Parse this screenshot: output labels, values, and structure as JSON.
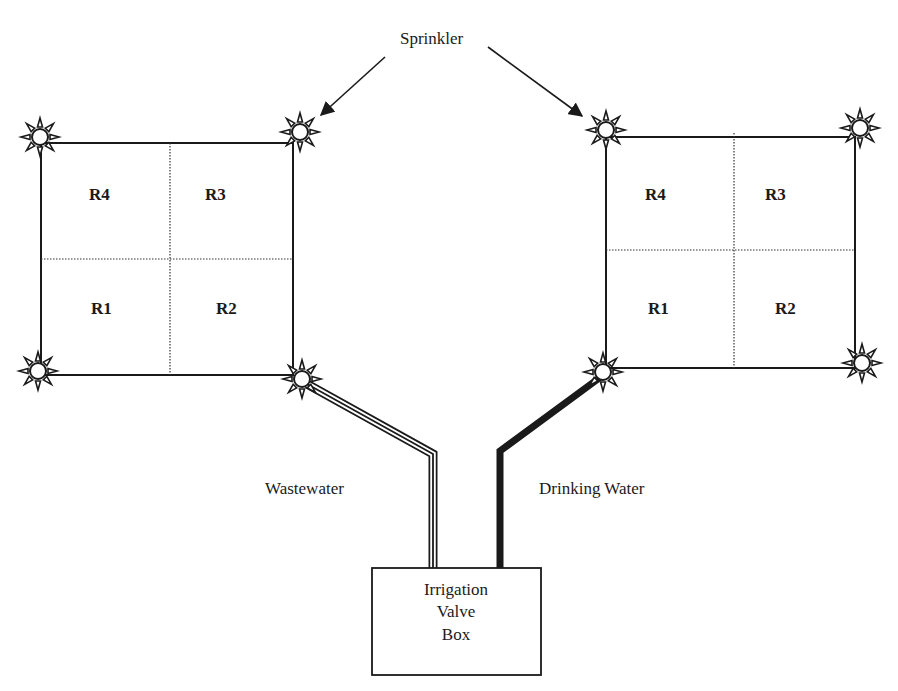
{
  "annotations": {
    "sprinkler": "Sprinkler",
    "wastewater": "Wastewater",
    "drinking_water": "Drinking Water"
  },
  "valve_box": {
    "lines": [
      "Irrigation",
      "Valve",
      "Box"
    ]
  },
  "plots": [
    {
      "id": "wastewater-plot",
      "water_source": "Wastewater",
      "regions": {
        "top_left": "R4",
        "top_right": "R3",
        "bottom_left": "R1",
        "bottom_right": "R2"
      },
      "sprinklers": 4
    },
    {
      "id": "drinking-water-plot",
      "water_source": "Drinking Water",
      "regions": {
        "top_left": "R4",
        "top_right": "R3",
        "bottom_left": "R1",
        "bottom_right": "R2"
      },
      "sprinklers": 4
    }
  ],
  "colors": {
    "ink": "#1a1a1a",
    "background": "#ffffff"
  }
}
